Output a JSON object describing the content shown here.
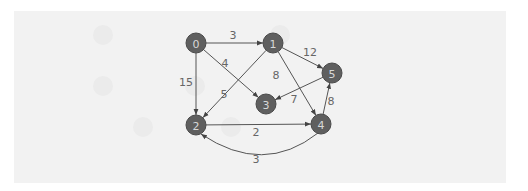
{
  "diagram": {
    "type": "directed-weighted-graph",
    "colors": {
      "background": "#ffffff",
      "panel": "#f2f2f2",
      "node_fill": "#5f5f5f",
      "node_text": "#d8d8d8",
      "edge": "#555555",
      "edge_label": "#666666"
    },
    "nodes": [
      {
        "id": "0",
        "label": "0",
        "x": 196,
        "y": 43
      },
      {
        "id": "1",
        "label": "1",
        "x": 273,
        "y": 43
      },
      {
        "id": "2",
        "label": "2",
        "x": 196,
        "y": 125
      },
      {
        "id": "3",
        "label": "3",
        "x": 266,
        "y": 104
      },
      {
        "id": "4",
        "label": "4",
        "x": 321,
        "y": 124
      },
      {
        "id": "5",
        "label": "5",
        "x": 332,
        "y": 73
      }
    ],
    "edges": [
      {
        "from": "0",
        "to": "1",
        "weight": "3",
        "label_x": 233,
        "label_y": 35
      },
      {
        "from": "0",
        "to": "3",
        "weight": "4",
        "label_x": 225,
        "label_y": 63
      },
      {
        "from": "0",
        "to": "2",
        "weight": "15",
        "label_x": 186,
        "label_y": 82
      },
      {
        "from": "1",
        "to": "5",
        "weight": "12",
        "label_x": 310,
        "label_y": 52
      },
      {
        "from": "1",
        "to": "4",
        "weight": "8",
        "label_x": 276,
        "label_y": 75
      },
      {
        "from": "1",
        "to": "2",
        "weight": "5",
        "label_x": 224,
        "label_y": 94
      },
      {
        "from": "5",
        "to": "3",
        "weight": "7",
        "label_x": 294,
        "label_y": 99
      },
      {
        "from": "4",
        "to": "5",
        "weight": "8",
        "label_x": 331,
        "label_y": 101
      },
      {
        "from": "2",
        "to": "4",
        "weight": "2",
        "label_x": 256,
        "label_y": 132
      },
      {
        "from": "4",
        "to": "2",
        "weight": "3",
        "label_x": 256,
        "label_y": 159,
        "curved": true
      }
    ]
  }
}
